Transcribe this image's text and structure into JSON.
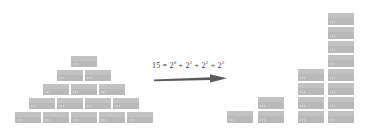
{
  "figure": {
    "width": 368,
    "height": 136,
    "background": "#ffffff",
    "block_color": "#b9b9b9",
    "block_border_color": "#ffffff",
    "block_dot_color": "#d6d6d6",
    "text_color": "#3a3a3a",
    "arrow_color": "#5a5a5a"
  },
  "equation": {
    "full_text": "15 = 2⁰ + 2¹ + 2² + 2³",
    "result": "15",
    "equals": "=",
    "terms": [
      {
        "base": "2",
        "exponent": "0",
        "value": 1
      },
      {
        "base": "2",
        "exponent": "1",
        "value": 2
      },
      {
        "base": "2",
        "exponent": "2",
        "value": 4
      },
      {
        "base": "2",
        "exponent": "3",
        "value": 8
      }
    ],
    "plus": "+",
    "total": 15
  },
  "arrow": {
    "direction": "right",
    "label": "transforms-into"
  },
  "left_figure": {
    "name": "staircase-pyramid",
    "total_blocks": 15,
    "arrangement": "triangular",
    "rows": [
      {
        "count": 1,
        "row_index": 0
      },
      {
        "count": 2,
        "row_index": 1
      },
      {
        "count": 3,
        "row_index": 2
      },
      {
        "count": 4,
        "row_index": 3
      },
      {
        "count": 5,
        "row_index": 4
      }
    ],
    "block_width": 28,
    "block_height": 13,
    "origin_x": 14,
    "origin_y": 55,
    "row_spacing": 14
  },
  "right_figure": {
    "name": "binary-columns",
    "total_blocks": 15,
    "arrangement": "power-of-two-columns",
    "columns": [
      {
        "count": 1,
        "power": 0,
        "label": "2⁰"
      },
      {
        "count": 2,
        "power": 1,
        "label": "2¹"
      },
      {
        "count": 4,
        "power": 2,
        "label": "2²"
      },
      {
        "count": 8,
        "power": 3,
        "label": "2³"
      }
    ],
    "block_width": 28,
    "block_height": 14,
    "baseline_y": 124,
    "column_x": [
      226,
      257,
      297,
      327
    ]
  }
}
